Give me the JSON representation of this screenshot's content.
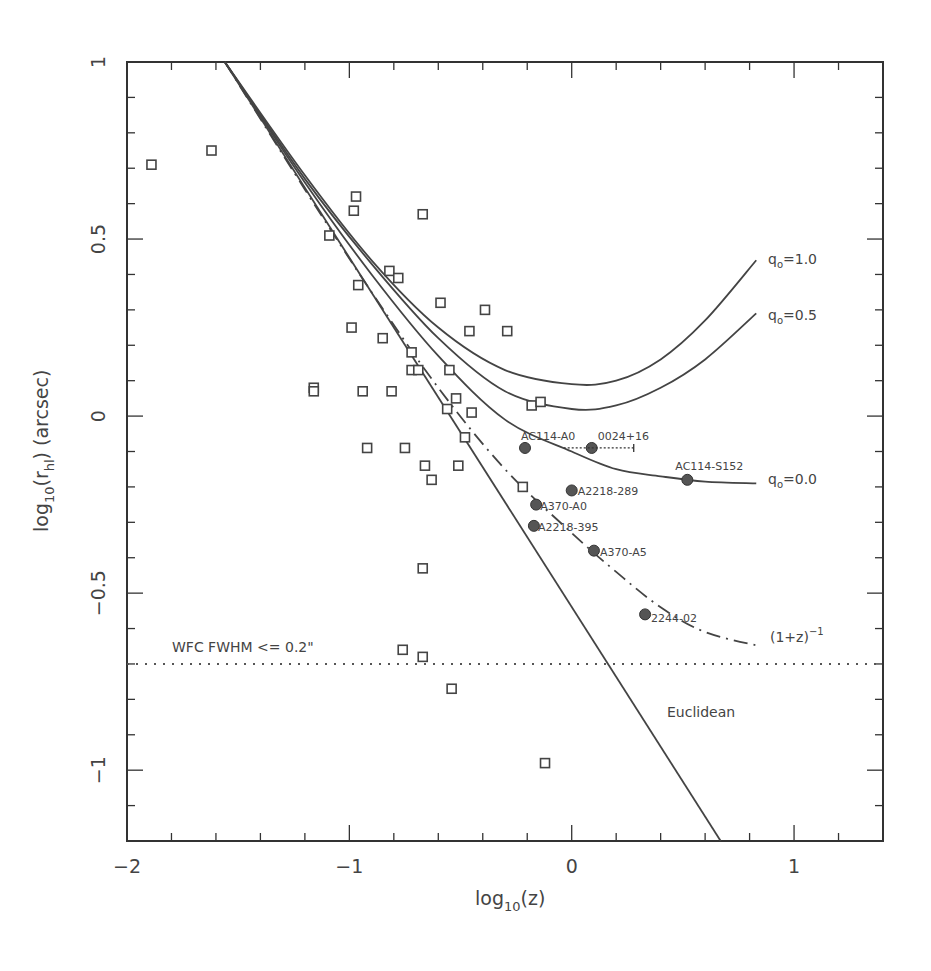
{
  "chart_data": {
    "type": "scatter",
    "title": "",
    "xlabel": "log10(z)",
    "ylabel": "log10(r_hl) (arcsec)",
    "xlim": [
      -2,
      1.4
    ],
    "ylim": [
      -1.2,
      1
    ],
    "grid": false,
    "x_ticks": [
      -2,
      -1,
      0,
      1
    ],
    "x_tick_labels": [
      "−2",
      "−1",
      "0",
      "1"
    ],
    "y_ticks": [
      1,
      0.5,
      0,
      -0.5,
      -1
    ],
    "y_tick_labels": [
      "1",
      "0.5",
      "0",
      "−0.5",
      "−1"
    ],
    "series": [
      {
        "name": "comparison sample",
        "marker": "open-square",
        "points": [
          [
            -1.89,
            0.71
          ],
          [
            -1.62,
            0.75
          ],
          [
            -1.09,
            0.51
          ],
          [
            -0.97,
            0.62
          ],
          [
            -0.98,
            0.58
          ],
          [
            -0.67,
            0.57
          ],
          [
            -0.99,
            0.25
          ],
          [
            -0.96,
            0.37
          ],
          [
            -0.82,
            0.41
          ],
          [
            -0.78,
            0.39
          ],
          [
            -0.85,
            0.22
          ],
          [
            -0.59,
            0.32
          ],
          [
            -0.39,
            0.3
          ],
          [
            -0.46,
            0.24
          ],
          [
            -0.29,
            0.24
          ],
          [
            -0.72,
            0.18
          ],
          [
            -0.72,
            0.13
          ],
          [
            -0.69,
            0.13
          ],
          [
            -0.55,
            0.13
          ],
          [
            -0.56,
            0.02
          ],
          [
            -0.52,
            0.05
          ],
          [
            -0.45,
            0.01
          ],
          [
            -0.48,
            -0.06
          ],
          [
            -1.16,
            0.08
          ],
          [
            -1.16,
            0.07
          ],
          [
            -0.94,
            0.07
          ],
          [
            -0.81,
            0.07
          ],
          [
            -0.92,
            -0.09
          ],
          [
            -0.75,
            -0.09
          ],
          [
            -0.66,
            -0.14
          ],
          [
            -0.63,
            -0.18
          ],
          [
            -0.51,
            -0.14
          ],
          [
            -0.18,
            0.03
          ],
          [
            -0.14,
            0.04
          ],
          [
            -0.22,
            -0.2
          ],
          [
            -0.67,
            -0.43
          ],
          [
            -0.76,
            -0.66
          ],
          [
            -0.67,
            -0.68
          ],
          [
            -0.54,
            -0.77
          ],
          [
            -0.12,
            -0.98
          ]
        ]
      },
      {
        "name": "lensed arcs",
        "marker": "filled-circle",
        "points": [
          {
            "label": "AC114-A0",
            "x": -0.21,
            "y": -0.09
          },
          {
            "label": "0024+16",
            "x": 0.09,
            "y": -0.09
          },
          {
            "label": "AC114-S152",
            "x": 0.52,
            "y": -0.18
          },
          {
            "label": "A2218-289",
            "x": 0.0,
            "y": -0.21
          },
          {
            "label": "A370-A0",
            "x": -0.16,
            "y": -0.25
          },
          {
            "label": "A2218-395",
            "x": -0.17,
            "y": -0.31
          },
          {
            "label": "A370-A5",
            "x": 0.1,
            "y": -0.38
          },
          {
            "label": "2244-02",
            "x": 0.33,
            "y": -0.56
          }
        ]
      }
    ],
    "curves": [
      {
        "name": "q0=1.0",
        "style": "solid",
        "points": [
          [
            -1.56,
            1.0
          ],
          [
            -1.2,
            0.68
          ],
          [
            -0.9,
            0.44
          ],
          [
            -0.6,
            0.25
          ],
          [
            -0.3,
            0.13
          ],
          [
            0,
            0.09
          ],
          [
            0.2,
            0.1
          ],
          [
            0.4,
            0.16
          ],
          [
            0.6,
            0.27
          ],
          [
            0.83,
            0.44
          ]
        ]
      },
      {
        "name": "q0=0.5",
        "style": "solid",
        "points": [
          [
            -1.56,
            1.0
          ],
          [
            -1.2,
            0.67
          ],
          [
            -0.9,
            0.43
          ],
          [
            -0.6,
            0.22
          ],
          [
            -0.3,
            0.07
          ],
          [
            0,
            0.02
          ],
          [
            0.2,
            0.03
          ],
          [
            0.4,
            0.08
          ],
          [
            0.6,
            0.16
          ],
          [
            0.83,
            0.29
          ]
        ]
      },
      {
        "name": "q0=0.0",
        "style": "solid",
        "points": [
          [
            -1.56,
            1.0
          ],
          [
            -1.2,
            0.66
          ],
          [
            -0.9,
            0.4
          ],
          [
            -0.6,
            0.17
          ],
          [
            -0.3,
            -0.01
          ],
          [
            0,
            -0.1
          ],
          [
            0.2,
            -0.15
          ],
          [
            0.4,
            -0.17
          ],
          [
            0.6,
            -0.185
          ],
          [
            0.83,
            -0.19
          ]
        ]
      },
      {
        "name": "(1+z)^-1",
        "style": "dash-dot",
        "points": [
          [
            -1.56,
            1.0
          ],
          [
            -1.2,
            0.64
          ],
          [
            -0.9,
            0.35
          ],
          [
            -0.6,
            0.08
          ],
          [
            -0.3,
            -0.15
          ],
          [
            0,
            -0.33
          ],
          [
            0.2,
            -0.44
          ],
          [
            0.4,
            -0.54
          ],
          [
            0.6,
            -0.61
          ],
          [
            0.85,
            -0.65
          ]
        ]
      },
      {
        "name": "Euclidean",
        "style": "solid",
        "points": [
          [
            -1.56,
            1.0
          ],
          [
            0.67,
            -1.2
          ]
        ]
      },
      {
        "name": "WFC FWHM <= 0.2\"",
        "style": "dotted",
        "points": [
          [
            -2,
            -0.7
          ],
          [
            1.4,
            -0.7
          ]
        ]
      }
    ],
    "annotations": {
      "q10": "q",
      "q10_sub": "o",
      "q10_val": "=1.0",
      "q05_val": "=0.5",
      "q00_val": "=0.0",
      "oneplusz": "(1+z)",
      "oneplusz_exp": "−1",
      "euclidean": "Euclidean",
      "wfc": "WFC FWHM <= 0.2\""
    },
    "labels": {
      "x_main": "log",
      "x_sub": "10",
      "x_tail": "(z)",
      "y_main": "log",
      "y_sub": "10",
      "y_mid": "(r",
      "y_sub2": "hl",
      "y_tail": ") (arcsec)"
    }
  }
}
